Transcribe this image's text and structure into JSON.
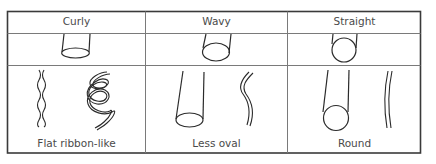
{
  "diagram": {
    "columns": [
      {
        "header": "Curly",
        "caption": "Flat ribbon-like",
        "cross_section": "flat-oval"
      },
      {
        "header": "Wavy",
        "caption": "Less oval",
        "cross_section": "oval"
      },
      {
        "header": "Straight",
        "caption": "Round",
        "cross_section": "round"
      }
    ],
    "colors": {
      "line": "#2b2b2b",
      "grid": "#7a7a7a",
      "border": "#3a3a3a",
      "text": "#4a4a4a"
    }
  }
}
